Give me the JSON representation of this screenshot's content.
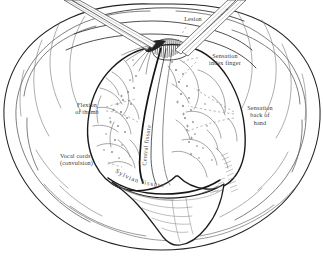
{
  "figure": {
    "medium": "engraving",
    "background_color": "#ffffff",
    "ink_color": "#3b3b3b",
    "outline_color": "#1e1e1e"
  },
  "labels": {
    "lesion": "Lesion",
    "sensation_index_finger": "Sensation\nindex finger",
    "sensation_back_of_hand": "Sensation\nback of\nhand",
    "flexion_of_thumb": "Flexion\nof thumb",
    "vocal_cords": "Vocal cords'\n(convulsion)",
    "sylvian_fissure": "Sylvian  fissure",
    "central_fissure": "Central fissure"
  },
  "elements": {
    "scalp_flap": "scalp-flap",
    "retractor_upper_left": "retractor-instrument",
    "retractor_upper_right": "probe-instrument",
    "lesion_hatching": "lesion-hatched-area",
    "temporal_flap": "temporal-lobe-flap",
    "stimulation_points": "cortical-stimulation-points",
    "leader_lines": "dashed-leader-lines"
  }
}
